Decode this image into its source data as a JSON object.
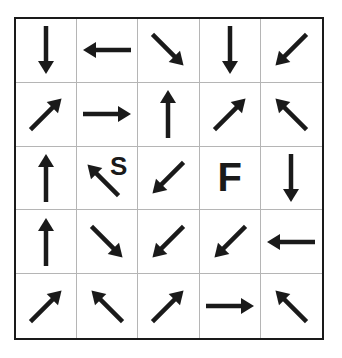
{
  "puzzle": {
    "rows": 5,
    "cols": 5,
    "colors": {
      "ink": "#1a1a1a",
      "gridline": "#b5b5b5",
      "background": "#ffffff"
    },
    "cells": [
      [
        {
          "arrow": "down"
        },
        {
          "arrow": "left"
        },
        {
          "arrow": "down-right"
        },
        {
          "arrow": "down"
        },
        {
          "arrow": "down-left"
        }
      ],
      [
        {
          "arrow": "up-right"
        },
        {
          "arrow": "right"
        },
        {
          "arrow": "up"
        },
        {
          "arrow": "up-right"
        },
        {
          "arrow": "up-left"
        }
      ],
      [
        {
          "arrow": "up"
        },
        {
          "arrow": "up-left",
          "label": "S"
        },
        {
          "arrow": "down-left"
        },
        {
          "arrow": null,
          "label": "F"
        },
        {
          "arrow": "down"
        }
      ],
      [
        {
          "arrow": "up"
        },
        {
          "arrow": "down-right"
        },
        {
          "arrow": "down-left"
        },
        {
          "arrow": "down-left"
        },
        {
          "arrow": "left"
        }
      ],
      [
        {
          "arrow": "up-right"
        },
        {
          "arrow": "up-left"
        },
        {
          "arrow": "up-right"
        },
        {
          "arrow": "right"
        },
        {
          "arrow": "up-left"
        }
      ]
    ],
    "start_label": "S",
    "finish_label": "F"
  }
}
